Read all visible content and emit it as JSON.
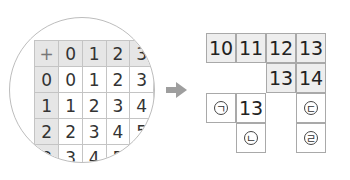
{
  "addition_table": {
    "corner_symbol": "+",
    "column_headers": [
      "0",
      "1",
      "2",
      "3"
    ],
    "rows": [
      {
        "header": "0",
        "values": [
          "0",
          "1",
          "2",
          "3"
        ]
      },
      {
        "header": "1",
        "values": [
          "1",
          "2",
          "3",
          "4"
        ]
      },
      {
        "header": "2",
        "values": [
          "2",
          "3",
          "4",
          "5"
        ]
      },
      {
        "header": "3",
        "values": [
          "3",
          "4",
          "5",
          ""
        ]
      }
    ]
  },
  "arrow": {
    "direction": "right",
    "color": "#9e9e9e"
  },
  "puzzle_grid": {
    "row1": [
      "10",
      "11",
      "12",
      "13"
    ],
    "row2": [
      "13",
      "14"
    ],
    "row3_given": "13",
    "blanks": {
      "a": "ㄱ",
      "b": "ㄴ",
      "c": "ㄷ",
      "d": "ㄹ"
    }
  }
}
